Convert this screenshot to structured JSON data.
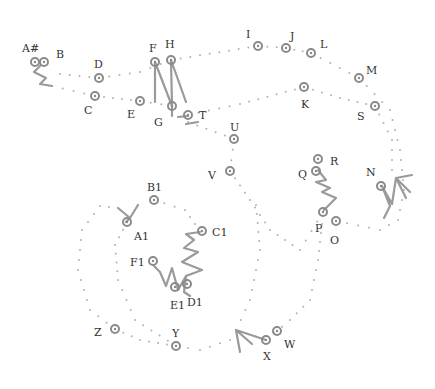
{
  "diagram": {
    "type": "dot-path",
    "colors": {
      "node": "#8a8a8a",
      "dot": "#b0b0b0",
      "stroke": "#9a9a9a",
      "label": "#333333"
    },
    "nodes": [
      {
        "id": "A#",
        "label": "A#"
      },
      {
        "id": "B",
        "label": "B"
      },
      {
        "id": "C",
        "label": "C"
      },
      {
        "id": "D",
        "label": "D"
      },
      {
        "id": "E",
        "label": "E"
      },
      {
        "id": "F",
        "label": "F"
      },
      {
        "id": "G",
        "label": "G"
      },
      {
        "id": "H",
        "label": "H"
      },
      {
        "id": "I",
        "label": "I"
      },
      {
        "id": "J",
        "label": "J"
      },
      {
        "id": "K",
        "label": "K"
      },
      {
        "id": "L",
        "label": "L"
      },
      {
        "id": "M",
        "label": "M"
      },
      {
        "id": "N",
        "label": "N"
      },
      {
        "id": "O",
        "label": "O"
      },
      {
        "id": "P",
        "label": "P"
      },
      {
        "id": "Q",
        "label": "Q"
      },
      {
        "id": "R",
        "label": "R"
      },
      {
        "id": "S",
        "label": "S"
      },
      {
        "id": "T",
        "label": "T"
      },
      {
        "id": "U",
        "label": "U"
      },
      {
        "id": "V",
        "label": "V"
      },
      {
        "id": "W",
        "label": "W"
      },
      {
        "id": "X",
        "label": "X"
      },
      {
        "id": "Y",
        "label": "Y"
      },
      {
        "id": "Z",
        "label": "Z"
      },
      {
        "id": "A1",
        "label": "A1"
      },
      {
        "id": "B1",
        "label": "B1"
      },
      {
        "id": "C1",
        "label": "C1"
      },
      {
        "id": "D1",
        "label": "D1"
      },
      {
        "id": "E1",
        "label": "E1"
      },
      {
        "id": "F1",
        "label": "F1"
      }
    ]
  }
}
